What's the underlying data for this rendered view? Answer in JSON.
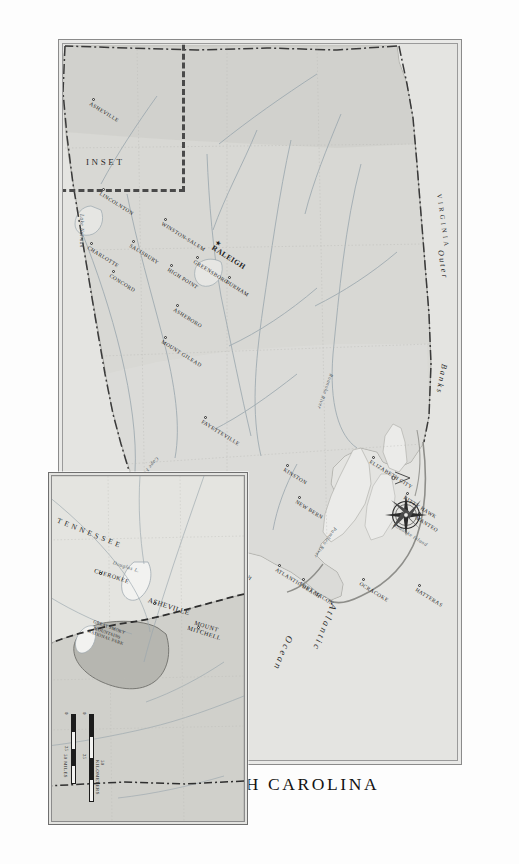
{
  "title": "NORTH CAROLINA",
  "ocean_label": "Atlantic Ocean",
  "ocean_label_line1": "Atlantic",
  "ocean_label_line2": "Ocean",
  "region_label": "Outer Banks",
  "region_label_word1": "Outer",
  "region_label_word2": "Banks",
  "neighbor_state": "VIRGINIA",
  "inset_word": "INSET",
  "compass_icon": "compass-rose-icon",
  "colors": {
    "land": "#d8d8d4",
    "land_highland": "#c9c9c4",
    "water": "#eeeeec",
    "ocean": "#e4e4e1",
    "border": "#8b8b8b",
    "park": "#b4b4ae",
    "ink": "#1a1a1a",
    "river": "#8e9aa2",
    "locator": "#4a4a4a"
  },
  "main_map": {
    "capital": {
      "name": "RALEIGH",
      "x": 196,
      "y": 236,
      "marker": "star"
    },
    "cities": [
      {
        "name": "ELIZABETH CITY",
        "x": 412,
        "y": 82,
        "rot": -58
      },
      {
        "name": "KITTY HAWK",
        "x": 448,
        "y": 48,
        "rot": -58
      },
      {
        "name": "MANTEO",
        "x": 468,
        "y": 36,
        "rot": -58
      },
      {
        "name": "HATTERAS",
        "x": 540,
        "y": 36,
        "rot": -58
      },
      {
        "name": "OCRACOKE",
        "x": 534,
        "y": 92,
        "rot": -58
      },
      {
        "name": "FORT MACON",
        "x": 534,
        "y": 152,
        "rot": -58
      },
      {
        "name": "ATLANTIC BEACH",
        "x": 520,
        "y": 176,
        "rot": -58
      },
      {
        "name": "NEW BERN",
        "x": 452,
        "y": 156,
        "rot": -58
      },
      {
        "name": "KINSTON",
        "x": 420,
        "y": 168,
        "rot": -58
      },
      {
        "name": "WILMINGTON",
        "x": 474,
        "y": 278,
        "rot": -58
      },
      {
        "name": "WRIGHTSVILLE BEACH",
        "x": 494,
        "y": 258,
        "rot": -58
      },
      {
        "name": "TABOR CITY",
        "x": 452,
        "y": 314,
        "rot": -58
      },
      {
        "name": "FAYETTEVILLE",
        "x": 372,
        "y": 250,
        "rot": -58
      },
      {
        "name": "DURHAM",
        "x": 232,
        "y": 226,
        "rot": -58
      },
      {
        "name": "MOUNT GILEAD",
        "x": 292,
        "y": 290,
        "rot": -58
      },
      {
        "name": "ASHEBORO",
        "x": 260,
        "y": 278,
        "rot": -58
      },
      {
        "name": "HIGH POINT",
        "x": 220,
        "y": 284,
        "rot": -58
      },
      {
        "name": "GREENSBORO",
        "x": 212,
        "y": 258,
        "rot": -58
      },
      {
        "name": "WINSTON-SALEM",
        "x": 174,
        "y": 290,
        "rot": -58
      },
      {
        "name": "SALISBURY",
        "x": 196,
        "y": 322,
        "rot": -58
      },
      {
        "name": "CONCORD",
        "x": 226,
        "y": 342,
        "rot": -58
      },
      {
        "name": "CHARLOTTE",
        "x": 198,
        "y": 364,
        "rot": -58
      },
      {
        "name": "LINCOLNTON",
        "x": 144,
        "y": 352,
        "rot": -58
      },
      {
        "name": "ASHEVILLE",
        "x": 54,
        "y": 362,
        "rot": -58
      }
    ],
    "water_features": [
      {
        "name": "Roanoke River",
        "x": 330,
        "y": 122,
        "rot": 20
      },
      {
        "name": "Cape Fear River",
        "x": 414,
        "y": 296,
        "rot": 40
      },
      {
        "name": "Pamlico River",
        "x": 484,
        "y": 118,
        "rot": 35
      },
      {
        "name": "Lake Norman",
        "x": 170,
        "y": 372,
        "rot": 0
      },
      {
        "name": "Roanoke Island",
        "x": 480,
        "y": 60,
        "rot": -58
      }
    ]
  },
  "inset_map": {
    "state_label": "TENNESSEE",
    "cities": [
      {
        "name": "MOUNT MITCHELL",
        "x": 150,
        "y": 44
      },
      {
        "name": "ASHEVILLE",
        "x": 126,
        "y": 88
      },
      {
        "name": "CHEROKEE",
        "x": 96,
        "y": 142
      }
    ],
    "water_features": [
      {
        "name": "Douglas L.",
        "x": 74,
        "y": 124
      }
    ],
    "park": {
      "name": "GREAT SMOKY MOUNTAINS NATIONAL PARK",
      "lines": [
        "GREAT SMOKY",
        "MOUNTAINS",
        "NATIONAL PARK"
      ]
    }
  },
  "scale_main": {
    "km": {
      "unit": "100 KILOMETERS",
      "ticks": [
        "0",
        "50",
        "100"
      ]
    },
    "mi": {
      "unit": "100 MILES",
      "ticks": [
        "0",
        "50",
        "100"
      ]
    }
  },
  "scale_inset": {
    "km": {
      "unit": "50 KILOMETERS",
      "ticks": [
        "0",
        "25",
        "50"
      ]
    },
    "mi": {
      "unit": "50 MILES",
      "ticks": [
        "0",
        "25",
        "50"
      ]
    }
  }
}
